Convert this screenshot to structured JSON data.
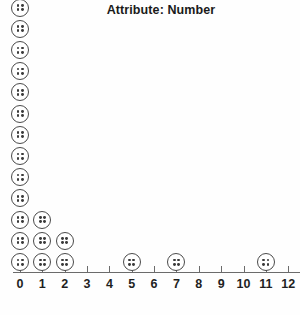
{
  "title": "Attribute: Number",
  "axis": {
    "tick_labels": [
      "0",
      "1",
      "2",
      "3",
      "4",
      "5",
      "6",
      "7",
      "8",
      "9",
      "10",
      "11",
      "12"
    ],
    "min": 0,
    "max": 12,
    "line_color": "#6b6b6b"
  },
  "marker": {
    "icon": "button-dot-icon",
    "fill": "#ffffff",
    "stroke": "#4a4a4a",
    "pip_color": "#3a3a3a"
  },
  "chart_data": {
    "type": "bar",
    "plot_style": "dot-plot",
    "title": "Attribute: Number",
    "xlabel": "",
    "ylabel": "",
    "categories": [
      0,
      1,
      2,
      3,
      4,
      5,
      6,
      7,
      8,
      9,
      10,
      11,
      12
    ],
    "values": [
      13,
      3,
      2,
      0,
      0,
      1,
      0,
      1,
      0,
      0,
      0,
      1,
      0
    ],
    "xlim": [
      0,
      12
    ],
    "grid": false,
    "legend": false,
    "total_count": 21
  }
}
